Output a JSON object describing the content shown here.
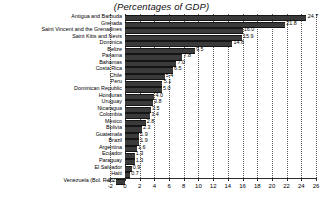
{
  "chart_data": {
    "type": "bar",
    "orientation": "horizontal",
    "title": "(Percentages of GDP)",
    "xlabel": "",
    "ylabel": "",
    "xlim": [
      -2,
      26
    ],
    "xticks": [
      -2,
      0,
      2,
      4,
      6,
      8,
      10,
      12,
      14,
      16,
      18,
      20,
      22,
      24,
      26
    ],
    "xtick_labels": [
      "-2",
      "0",
      "2",
      "4",
      "6",
      "8",
      "10",
      "12",
      "14",
      "16",
      "18",
      "20",
      "22",
      "24",
      "26"
    ],
    "grid": true,
    "grid_style": "dotted-vertical",
    "legend": null,
    "bar_color": "#3a3a3a",
    "categories": [
      "Antigua and Barbuda",
      "Grenada",
      "Saint Vincent and the Grenadines",
      "Saint Kitts and Nevis",
      "Dominica",
      "Belize",
      "Panama",
      "Bahamas",
      "Costa Rica",
      "Chile",
      "Peru",
      "Dominican Republic",
      "Honduras",
      "Uruguay",
      "Nicaragua",
      "Colombia",
      "Mexico",
      "Bolivia",
      "Guatemala",
      "Brazil",
      "Argentina",
      "Ecuador",
      "Paraguay",
      "El Salvador",
      "Haiti",
      "Venezuela (Bol. Rep. of)"
    ],
    "values": [
      24.7,
      21.8,
      16.0,
      15.9,
      14.6,
      9.5,
      7.8,
      7.0,
      6.5,
      5.4,
      5.1,
      5.0,
      4.0,
      3.8,
      3.5,
      3.4,
      2.8,
      2.3,
      1.9,
      1.9,
      1.6,
      1.3,
      1.3,
      0.9,
      0.7,
      -1.2
    ],
    "value_labels": [
      "24.7",
      "21.8",
      "16.0",
      "15.9",
      "14.6",
      "9.5",
      "7.8",
      "7.0",
      "6.5",
      "5.4",
      "5.1",
      "5.0",
      "4.0",
      "3.8",
      "3.5",
      "3.4",
      "2.8",
      "2.3",
      "1.9",
      "1.9",
      "1.6",
      "1.3",
      "1.3",
      "0.9",
      "0.7",
      "-1.2"
    ]
  }
}
